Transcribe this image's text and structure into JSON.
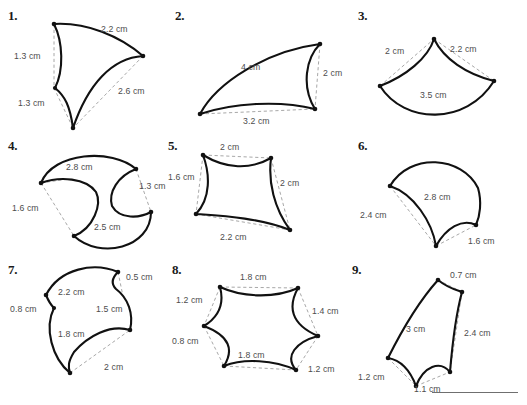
{
  "page": {
    "width": 527,
    "height": 405,
    "background_color": "#ffffff",
    "ink_color": "#111111",
    "dimension_line_color": "#a8a8a8",
    "label_color": "#4d4d4d",
    "top_faint_text": "",
    "footer_rule_visible": true
  },
  "figures": [
    {
      "number": "1.",
      "shape": "curved triangle (three concave/convex arc sides)",
      "labels": [
        {
          "text": "2.2 cm",
          "x": 93,
          "y": 18
        },
        {
          "text": "1.3 cm",
          "x": 25,
          "y": 45
        },
        {
          "text": "2.6 cm",
          "x": 110,
          "y": 80
        },
        {
          "text": "1.3 cm",
          "x": 29,
          "y": 93
        }
      ]
    },
    {
      "number": "2.",
      "shape": "curved quadrilateral wing (crescent-like)",
      "labels": [
        {
          "text": "4 cm",
          "x": 74,
          "y": 47
        },
        {
          "text": "2 cm",
          "x": 127,
          "y": 57
        },
        {
          "text": "3.2 cm",
          "x": 83,
          "y": 103
        }
      ]
    },
    {
      "number": "3.",
      "shape": "curved triangle with concave top arcs and convex base",
      "labels": [
        {
          "text": "2 cm",
          "x": 27,
          "y": 40
        },
        {
          "text": "2.2 cm",
          "x": 88,
          "y": 38
        },
        {
          "text": "3.5 cm",
          "x": 72,
          "y": 74
        }
      ]
    },
    {
      "number": "4.",
      "shape": "curved quadrilateral with two concave bites",
      "labels": [
        {
          "text": "2.8 cm",
          "x": 60,
          "y": 14
        },
        {
          "text": "1.3 cm",
          "x": 115,
          "y": 40
        },
        {
          "text": "1.6 cm",
          "x": 12,
          "y": 57
        },
        {
          "text": "2.5 cm",
          "x": 78,
          "y": 76
        }
      ]
    },
    {
      "number": "5.",
      "shape": "astroid-like curved square (four concave sides)",
      "labels": [
        {
          "text": "2 cm",
          "x": 45,
          "y": 3
        },
        {
          "text": "1.6 cm",
          "x": 2,
          "y": 35
        },
        {
          "text": "2 cm",
          "x": 82,
          "y": 40
        },
        {
          "text": "2.2 cm",
          "x": 42,
          "y": 78
        }
      ]
    },
    {
      "number": "6.",
      "shape": "curved triangle: convex top, concave left and bottom",
      "labels": [
        {
          "text": "2.8 cm",
          "x": 60,
          "y": 39
        },
        {
          "text": "2.4 cm",
          "x": 8,
          "y": 65
        },
        {
          "text": "1.6 cm",
          "x": 88,
          "y": 88
        }
      ]
    },
    {
      "number": "7.",
      "shape": "curved pentagon with concave notches",
      "labels": [
        {
          "text": "0.5 cm",
          "x": 97,
          "y": 13
        },
        {
          "text": "2.2 cm",
          "x": 39,
          "y": 27
        },
        {
          "text": "1.5 cm",
          "x": 73,
          "y": 41
        },
        {
          "text": "0.8 cm",
          "x": 2,
          "y": 41
        },
        {
          "text": "1.8 cm",
          "x": 34,
          "y": 62
        },
        {
          "text": "2 cm",
          "x": 82,
          "y": 90
        }
      ]
    },
    {
      "number": "8.",
      "shape": "curved hexagon with alternating concave arcs",
      "labels": [
        {
          "text": "1.8 cm",
          "x": 54,
          "y": 10
        },
        {
          "text": "1.2 cm",
          "x": 6,
          "y": 33
        },
        {
          "text": "1.4 cm",
          "x": 101,
          "y": 40
        },
        {
          "text": "0.8 cm",
          "x": 2,
          "y": 69
        },
        {
          "text": "1.8 cm",
          "x": 48,
          "y": 78
        },
        {
          "text": "1.2 cm",
          "x": 96,
          "y": 86
        }
      ]
    },
    {
      "number": "9.",
      "shape": "curved pentagon, tall with scalloped base",
      "labels": [
        {
          "text": "0.7 cm",
          "x": 77,
          "y": 8
        },
        {
          "text": "3 cm",
          "x": 39,
          "y": 60
        },
        {
          "text": "2.4 cm",
          "x": 83,
          "y": 62
        },
        {
          "text": "1.2 cm",
          "x": 2,
          "y": 98
        },
        {
          "text": "1.1 cm",
          "x": 51,
          "y": 107
        }
      ]
    }
  ]
}
